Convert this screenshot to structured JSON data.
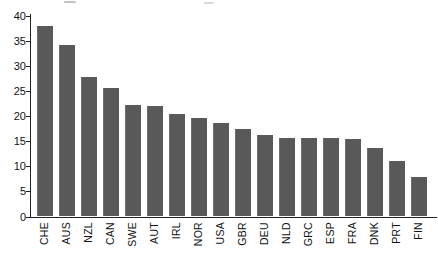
{
  "chart_data": {
    "type": "bar",
    "title": "",
    "xlabel": "",
    "ylabel": "",
    "categories": [
      "CHE",
      "AUS",
      "NZL",
      "CAN",
      "SWE",
      "AUT",
      "IRL",
      "NOR",
      "USA",
      "GBR",
      "DEU",
      "NLD",
      "GRC",
      "ESP",
      "FRA",
      "DNK",
      "PRT",
      "FIN"
    ],
    "values": [
      38.0,
      34.3,
      27.8,
      25.7,
      22.3,
      22.1,
      20.4,
      19.6,
      18.7,
      17.4,
      16.3,
      15.7,
      15.7,
      15.7,
      15.5,
      13.6,
      11.1,
      7.8
    ],
    "ylim": [
      0,
      40
    ],
    "yticks": [
      0,
      5,
      10,
      15,
      20,
      25,
      30,
      35,
      40
    ],
    "grid": false,
    "legend": "none",
    "bar_color": "#595959",
    "axis_color": "#222222",
    "label_color": "#111111"
  }
}
